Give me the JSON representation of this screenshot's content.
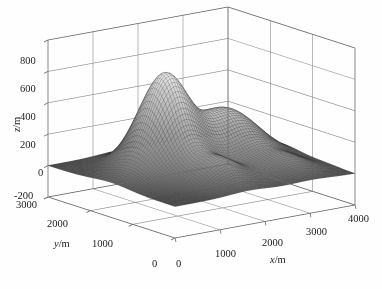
{
  "figure": {
    "type": "3d-mesh-surface-plot",
    "background_color": "#ffffff",
    "mesh_color_light": "#f2f2f2",
    "mesh_color_dark": "#4a4a4a",
    "axis_color": "#6b6b6b",
    "grid_color": "#8a8a8a",
    "text_color": "#1c1c1c"
  },
  "axes": {
    "z": {
      "label": "z/m",
      "label_parts": {
        "var": "z",
        "unit": "/m"
      },
      "ticks": [
        "800",
        "600",
        "400",
        "200",
        "0",
        "-200"
      ],
      "tick_values": [
        800,
        600,
        400,
        200,
        0,
        -200
      ],
      "range": [
        -200,
        800
      ]
    },
    "y": {
      "label": "y/m",
      "label_parts": {
        "var": "y",
        "unit": "/m"
      },
      "ticks": [
        "3000",
        "2000",
        "1000",
        "0"
      ],
      "tick_values": [
        3000,
        2000,
        1000,
        0
      ],
      "range": [
        0,
        3000
      ]
    },
    "x": {
      "label": "x/m",
      "label_parts": {
        "var": "x",
        "unit": "/m"
      },
      "ticks": [
        "0",
        "1000",
        "2000",
        "3000",
        "4000"
      ],
      "tick_values": [
        0,
        1000,
        2000,
        3000,
        4000
      ],
      "range": [
        0,
        4000
      ]
    }
  },
  "chart_data": {
    "type": "surface",
    "title": "",
    "xlabel": "x/m",
    "ylabel": "y/m",
    "zlabel": "z/m",
    "xlim": [
      0,
      4000
    ],
    "ylim": [
      0,
      3000
    ],
    "zlim": [
      -200,
      800
    ],
    "grid": true,
    "legend": "none",
    "colormap": "gray",
    "mesh_nx": 72,
    "mesh_ny": 72,
    "peaks": [
      {
        "name": "main-peak",
        "x": 1500,
        "y": 1850,
        "z": 560,
        "sx": 420,
        "sy": 420
      },
      {
        "name": "secondary-ridge",
        "x": 2750,
        "y": 1750,
        "z": 330,
        "sx": 620,
        "sy": 520
      },
      {
        "name": "front-mound",
        "x": 1650,
        "y": 700,
        "z": 150,
        "sx": 420,
        "sy": 330
      },
      {
        "name": "right-mound",
        "x": 3050,
        "y": 620,
        "z": 85,
        "sx": 430,
        "sy": 300
      },
      {
        "name": "left-swell",
        "x": 700,
        "y": 1500,
        "z": 70,
        "sx": 450,
        "sy": 430
      },
      {
        "name": "far-dip",
        "x": 2250,
        "y": 1100,
        "z": -45,
        "sx": 430,
        "sy": 330
      }
    ],
    "base_level": 0,
    "z_sample_note": "Peak apex reads just under the 600 m gridline; plain sits at z=0 m."
  },
  "view": {
    "azimuth_deg": -37.5,
    "elevation_deg": 30,
    "projection": "orthographic"
  },
  "geometry": {
    "corner_origin": [
      48,
      197
    ],
    "corner_front": [
      175,
      238
    ],
    "corner_right": [
      355,
      205
    ],
    "corner_back_top": [
      212,
      22
    ],
    "box_top_z_px": 40,
    "box_bottom_z_px": 197
  },
  "labels": {
    "z_ticks": [
      {
        "text": "800",
        "left": 20,
        "top": 56
      },
      {
        "text": "600",
        "left": 20,
        "top": 84
      },
      {
        "text": "400",
        "left": 20,
        "top": 112
      },
      {
        "text": "200",
        "left": 20,
        "top": 140
      },
      {
        "text": "0",
        "left": 38,
        "top": 168
      },
      {
        "text": "-200",
        "left": 14,
        "top": 191
      }
    ],
    "y_ticks": [
      {
        "text": "3000",
        "left": 16,
        "top": 200
      },
      {
        "text": "2000",
        "left": 47,
        "top": 219
      },
      {
        "text": "1000",
        "left": 92,
        "top": 239
      },
      {
        "text": "0",
        "left": 152,
        "top": 259
      }
    ],
    "x_ticks": [
      {
        "text": "0",
        "left": 176,
        "top": 259
      },
      {
        "text": "1000",
        "left": 215,
        "top": 249
      },
      {
        "text": "2000",
        "left": 262,
        "top": 238
      },
      {
        "text": "3000",
        "left": 306,
        "top": 227
      },
      {
        "text": "4000",
        "left": 348,
        "top": 214
      }
    ],
    "axis_titles": {
      "z": {
        "left": 12,
        "top": 132
      },
      "y": {
        "left": 54,
        "top": 239
      },
      "x": {
        "left": 270,
        "top": 255
      }
    }
  }
}
